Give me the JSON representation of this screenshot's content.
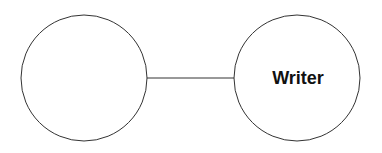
{
  "diagram": {
    "nodes": [
      {
        "id": "left",
        "label": "",
        "cx": 84,
        "cy": 78,
        "r": 63
      },
      {
        "id": "right",
        "label": "Writer",
        "cx": 297,
        "cy": 78,
        "r": 63
      }
    ],
    "edges": [
      {
        "from": "left",
        "to": "right"
      }
    ],
    "colors": {
      "stroke": "#333333",
      "background": "#ffffff",
      "text": "#111111"
    }
  }
}
